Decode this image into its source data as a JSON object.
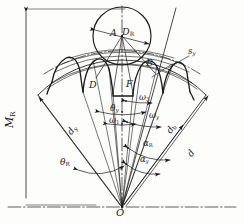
{
  "figure": {
    "type": "engineering-diagram",
    "background_color": "#fdfdfc",
    "line_color": "#1a1a1a"
  },
  "labels": {
    "measurement_over_pins": "M",
    "measurement_over_pins_sub": "R",
    "pin_diameter": "D",
    "pin_diameter_sub": "R",
    "point_a": "A",
    "point_b": "B",
    "point_d": "D",
    "point_f": "F",
    "apex_o": "O",
    "arc_thickness": "s",
    "arc_thickness_sub": "y",
    "theta_y": "θ",
    "theta_y_sub": "y",
    "theta_r": "θ",
    "theta_r_sub": "R",
    "omega_1": "ω",
    "omega_1_sub": "1",
    "omega_3": "ω",
    "omega_3_sub": "3",
    "omega_y": "ω",
    "omega_y_sub": "y",
    "alpha_r": "α",
    "alpha_r_sub": "R",
    "alpha_y": "α",
    "alpha_y_sub": "y",
    "alpha_y2": "α",
    "alpha_y2_sub": "y",
    "dia_d": "d",
    "dia_db": "d",
    "dia_db_sub": "b",
    "dia_dy": "d",
    "dia_dy_sub": "y"
  },
  "geometry": {
    "apex": {
      "x": 122,
      "y": 207
    },
    "pin_circle": {
      "cx": 122,
      "cy": 36,
      "r": 29
    },
    "arc_radii": [
      72,
      88,
      104,
      118,
      132,
      146,
      182
    ],
    "sector_half_angle_deg": 42
  }
}
